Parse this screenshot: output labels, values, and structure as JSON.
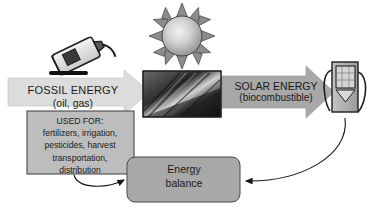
{
  "diagram": {
    "colors": {
      "fossil_arrow_fill": "#dcdcdc",
      "solar_arrow_fill": "#a8a8a8",
      "box_fill": "#a8a8a8",
      "usedfor_fill": "#bdbdbd",
      "outline": "#333333",
      "text": "#1a1a1a"
    },
    "nodes": {
      "fossil_arrow": {
        "line1": "FOSSIL ENERGY",
        "line2": "(oil, gas)",
        "direction": "right"
      },
      "solar_arrow": {
        "line1": "SOLAR ENERGY",
        "line2": "(biocombustible)",
        "direction": "right"
      },
      "used_for_box": {
        "heading": "USED FOR:",
        "lines": [
          "fertilizers, irrigation,",
          "pesticides, harvest",
          "transportation,",
          "distribution"
        ]
      },
      "energy_balance_box": {
        "line1": "Energy",
        "line2": "balance"
      }
    },
    "icons": {
      "oil_can": "oil-can-icon",
      "sun": "sun-icon",
      "crop_photo": "wheat-crop-photo",
      "fuel_pump": "fuel-pump-icon"
    },
    "connectors": [
      {
        "name": "used-for-to-balance",
        "from": "used_for_box",
        "to": "energy_balance_box"
      },
      {
        "name": "fuel-pump-to-balance",
        "from": "fuel_pump",
        "to": "energy_balance_box"
      }
    ]
  }
}
